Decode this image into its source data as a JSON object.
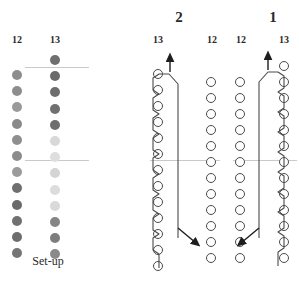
{
  "figure": {
    "caption": "Set-up",
    "steps": [
      {
        "label": "2",
        "left_col": "13",
        "right_col": "12"
      },
      {
        "label": "1",
        "left_col": "12",
        "right_col": "13"
      }
    ]
  },
  "setup": {
    "caption": "Set-up",
    "columns": [
      {
        "label": "12",
        "count": 12,
        "shades": [
          "#8d8d8d",
          "#8d8d8d",
          "#9a9a9a",
          "#8a8a8a",
          "#8f8f8f",
          "#8c8c8c",
          "#9b9b9b",
          "#6f6f6f",
          "#6a6a6a",
          "#707070",
          "#6d6d6d",
          "#757575"
        ]
      },
      {
        "label": "13",
        "count": 13,
        "shades": [
          "#6f6f6f",
          "#6b6b6b",
          "#6d6d6d",
          "#707070",
          "#6e6e6e",
          "#d8d8d8",
          "#dedede",
          "#d4d4d4",
          "#dcdcdc",
          "#d9d9d9",
          "#858585",
          "#7d7d7d",
          "#8a8a8a"
        ]
      }
    ]
  },
  "diagrams": {
    "middle": {
      "number": "2",
      "left_label": "13",
      "right_label": "12",
      "left_ring_count": 13,
      "right_ring_count": 12,
      "arrow_top": "up",
      "arrow_bottom": "down-right"
    },
    "right": {
      "number": "1",
      "left_label": "12",
      "right_label": "13",
      "left_ring_count": 12,
      "right_ring_count": 13,
      "arrow_top": "up",
      "arrow_bottom": "down-left"
    }
  },
  "colors": {
    "stroke": "#4a4a4a",
    "guide": "#c9c9c9",
    "text": "#2a2a2a",
    "background": "#ffffff"
  }
}
